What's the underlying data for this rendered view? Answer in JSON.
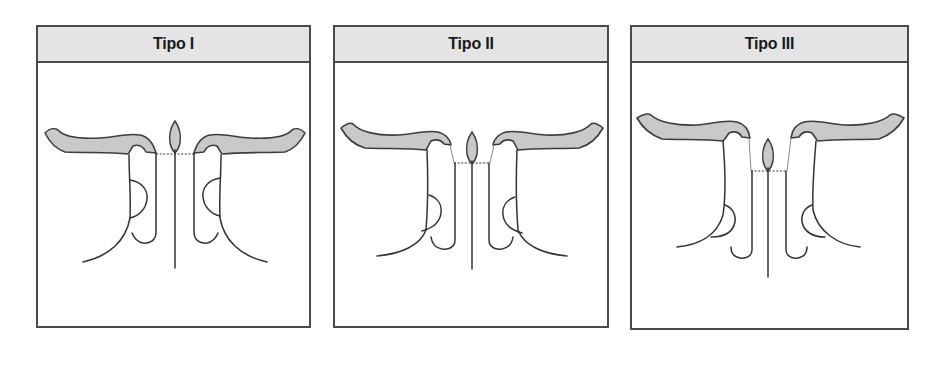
{
  "figure": {
    "panels": [
      {
        "title": "Tipo I",
        "description": "Uvula-like drop above midline septum; dotted line at level of band tips; inner hooks attached directly to band"
      },
      {
        "title": "Tipo II",
        "description": "Drop slightly lower; short gray connectors from band tips down to dotted line; hooks start at dotted line"
      },
      {
        "title": "Tipo III",
        "description": "Drop lower still; longer gray connectors from band tips down to dotted line; hooks start at dotted line"
      }
    ],
    "colors": {
      "header_bg": "#e4e4e4",
      "border": "#4a4a4a",
      "band_fill": "#c9c9c9",
      "stroke": "#333333",
      "title_text": "#1a1a1a"
    }
  }
}
